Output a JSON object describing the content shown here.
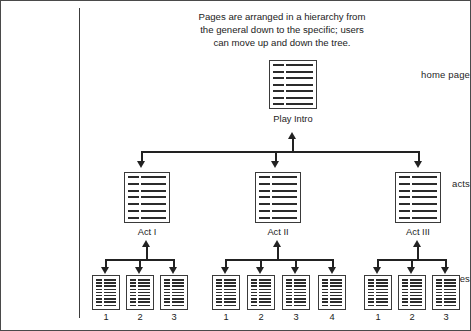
{
  "figure": {
    "caption_lines": [
      "Pages are arranged in a hierarchy from",
      "the general down to the specific; users",
      "can move up and down the tree."
    ],
    "row_labels": {
      "home_page": "home page",
      "acts": "acts",
      "scenes": "scenes"
    }
  },
  "tree": {
    "root": {
      "label": "Play Intro",
      "icon": "page-icon"
    },
    "acts": [
      {
        "label": "Act I",
        "icon": "page-icon",
        "scenes": [
          {
            "label": "1",
            "icon": "page-icon"
          },
          {
            "label": "2",
            "icon": "page-icon"
          },
          {
            "label": "3",
            "icon": "page-icon"
          }
        ]
      },
      {
        "label": "Act II",
        "icon": "page-icon",
        "scenes": [
          {
            "label": "1",
            "icon": "page-icon"
          },
          {
            "label": "2",
            "icon": "page-icon"
          },
          {
            "label": "3",
            "icon": "page-icon"
          },
          {
            "label": "4",
            "icon": "page-icon"
          }
        ]
      },
      {
        "label": "Act III",
        "icon": "page-icon",
        "scenes": [
          {
            "label": "1",
            "icon": "page-icon"
          },
          {
            "label": "2",
            "icon": "page-icon"
          },
          {
            "label": "3",
            "icon": "page-icon"
          }
        ]
      }
    ]
  },
  "style": {
    "line_color": "#222222",
    "border_color": "#3a3a3a",
    "frame_color": "#4a4a4a",
    "text_color": "#1b1b1b",
    "background": "#ffffff"
  }
}
